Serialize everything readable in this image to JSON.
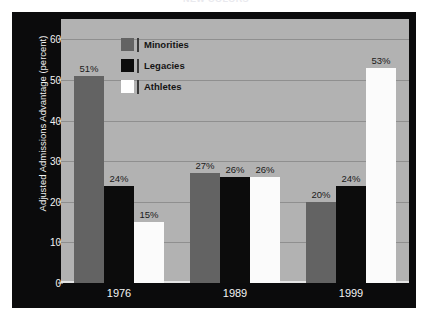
{
  "figure": {
    "title_sliver": "NEW COLORS",
    "background": "#ffffff",
    "panel_color": "#0b0b0c",
    "plot_color": "#b2b2b2"
  },
  "chart_data": {
    "type": "bar",
    "title": "",
    "xlabel": "",
    "ylabel": "Adjusted Admissions Advantage (percent)",
    "categories": [
      "1976",
      "1989",
      "1999"
    ],
    "ylim": [
      0,
      65
    ],
    "yticks": [
      0,
      10,
      20,
      30,
      40,
      50,
      60
    ],
    "ytick_labels": [
      "0",
      "10",
      "20",
      "30",
      "40",
      "50",
      "60"
    ],
    "grid": true,
    "legend_position": "upper-center",
    "series": [
      {
        "name": "Minorities",
        "color": "#636363",
        "values": [
          51,
          27,
          20
        ],
        "labels": [
          "51%",
          "27%",
          "20%"
        ]
      },
      {
        "name": "Legacies",
        "color": "#0c0c0c",
        "values": [
          24,
          26,
          24
        ],
        "labels": [
          "24%",
          "26%",
          "24%"
        ]
      },
      {
        "name": "Athletes",
        "color": "#ffffff",
        "values": [
          15,
          26,
          53
        ],
        "labels": [
          "15%",
          "26%",
          "53%"
        ]
      }
    ]
  }
}
